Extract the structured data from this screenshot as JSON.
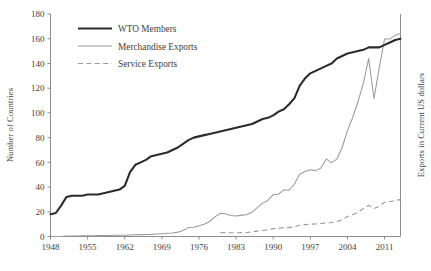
{
  "chart_data": {
    "type": "line",
    "title": "",
    "xlabel": "",
    "ylabel": "Number of Countries",
    "y2label": "Exports in Current US dollars",
    "grid": false,
    "legend_position": "top-left",
    "xlim": [
      1948,
      2014
    ],
    "ylim": [
      0,
      180
    ],
    "xticks": [
      1948,
      1955,
      1962,
      1969,
      1976,
      1983,
      1990,
      1997,
      2004,
      2011
    ],
    "yticks": [
      0,
      20,
      40,
      60,
      80,
      100,
      120,
      140,
      160,
      180
    ],
    "x": [
      1948,
      1949,
      1950,
      1951,
      1952,
      1953,
      1954,
      1955,
      1956,
      1957,
      1958,
      1959,
      1960,
      1961,
      1962,
      1963,
      1964,
      1965,
      1966,
      1967,
      1968,
      1969,
      1970,
      1971,
      1972,
      1973,
      1974,
      1975,
      1976,
      1977,
      1978,
      1979,
      1980,
      1981,
      1982,
      1983,
      1984,
      1985,
      1986,
      1987,
      1988,
      1989,
      1990,
      1991,
      1992,
      1993,
      1994,
      1995,
      1996,
      1997,
      1998,
      1999,
      2000,
      2001,
      2002,
      2003,
      2004,
      2005,
      2006,
      2007,
      2008,
      2009,
      2010,
      2011,
      2012,
      2013,
      2014
    ],
    "series": [
      {
        "name": "WTO Members",
        "style": "solid-thick",
        "color": "#2b2b2b",
        "axis": "left",
        "values": [
          18,
          19,
          25,
          32,
          33,
          33,
          33,
          34,
          34,
          34,
          35,
          36,
          37,
          38,
          41,
          52,
          58,
          60,
          62,
          65,
          66,
          67,
          68,
          70,
          72,
          75,
          78,
          80,
          81,
          82,
          83,
          84,
          85,
          86,
          87,
          88,
          89,
          90,
          91,
          93,
          95,
          96,
          98,
          101,
          103,
          107,
          112,
          122,
          128,
          132,
          134,
          136,
          138,
          140,
          144,
          146,
          148,
          149,
          150,
          151,
          153,
          153,
          153,
          155,
          157,
          159,
          160
        ]
      },
      {
        "name": "Merchandise Exports",
        "style": "solid-thin",
        "color": "#9a9a9a",
        "axis": "right",
        "values": [
          0,
          0,
          0,
          0.5,
          0.6,
          0.6,
          0.7,
          0.8,
          0.9,
          1.0,
          1.0,
          1.1,
          1.3,
          1.4,
          1.5,
          1.7,
          1.9,
          2.1,
          2.3,
          2.4,
          2.8,
          3.2,
          3.6,
          4.0,
          4.9,
          6.8,
          10.0,
          10.5,
          12.0,
          13.8,
          16.8,
          22.0,
          26.0,
          25.5,
          23.5,
          23.0,
          24.0,
          24.5,
          27.5,
          32.5,
          37.5,
          40.5,
          47.0,
          47.5,
          52.5,
          52.0,
          59.0,
          70.0,
          73.0,
          75.0,
          74.0,
          77.0,
          87.0,
          83.0,
          87.0,
          100.0,
          119.0,
          134.0,
          152.0,
          172.0,
          200.0,
          155.0,
          190.0,
          222.0,
          222.0,
          226.0,
          228.0
        ]
      },
      {
        "name": "Service Exports",
        "style": "dashed",
        "color": "#9a9a9a",
        "axis": "right",
        "values": [
          null,
          null,
          null,
          null,
          null,
          null,
          null,
          null,
          null,
          null,
          null,
          null,
          null,
          null,
          null,
          null,
          null,
          null,
          null,
          null,
          null,
          null,
          null,
          null,
          null,
          null,
          null,
          null,
          null,
          null,
          null,
          null,
          4.2,
          4.3,
          4.2,
          4.2,
          4.3,
          4.5,
          5.2,
          6.0,
          6.8,
          7.5,
          8.8,
          9.0,
          10.0,
          10.0,
          11.0,
          12.6,
          13.3,
          13.8,
          14.0,
          14.6,
          15.4,
          15.6,
          16.6,
          19.0,
          22.5,
          24.5,
          27.5,
          31.5,
          35.0,
          31.5,
          34.0,
          38.5,
          39.0,
          40.5,
          41.5
        ]
      }
    ],
    "annotations": []
  },
  "legend": {
    "items": [
      {
        "label": "WTO Members"
      },
      {
        "label": "Merchandise Exports"
      },
      {
        "label": "Service Exports"
      }
    ]
  },
  "axes": {
    "left_title": "Number of Countries",
    "right_title": "Exports in Current US dollars",
    "y_tick_labels": [
      "0",
      "20",
      "40",
      "60",
      "80",
      "100",
      "120",
      "140",
      "160",
      "180"
    ],
    "x_tick_labels": [
      "1948",
      "1955",
      "1962",
      "1969",
      "1976",
      "1983",
      "1990",
      "1997",
      "2004",
      "2011"
    ]
  }
}
